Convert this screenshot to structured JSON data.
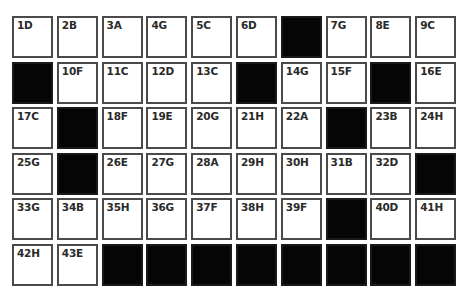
{
  "puzzle": {
    "columns": 10,
    "rows": 6,
    "colors": {
      "filled": "#050505",
      "empty": "#ffffff",
      "border": "#4a4a4a"
    },
    "cells": [
      [
        "1D",
        "2B",
        "3A",
        "4G",
        "5C",
        "6D",
        null,
        "7G",
        "8E",
        "9C"
      ],
      [
        null,
        "10F",
        "11C",
        "12D",
        "13C",
        null,
        "14G",
        "15F",
        null,
        "16E"
      ],
      [
        "17C",
        null,
        "18F",
        "19E",
        "20G",
        "21H",
        "22A",
        null,
        "23B",
        "24H"
      ],
      [
        "25G",
        null,
        "26E",
        "27G",
        "28A",
        "29H",
        "30H",
        "31B",
        "32D",
        null
      ],
      [
        "33G",
        "34B",
        "35H",
        "36G",
        "37F",
        "38H",
        "39F",
        null,
        "40D",
        "41H"
      ],
      [
        "42H",
        "43E",
        null,
        null,
        null,
        null,
        null,
        null,
        null,
        null
      ]
    ]
  }
}
